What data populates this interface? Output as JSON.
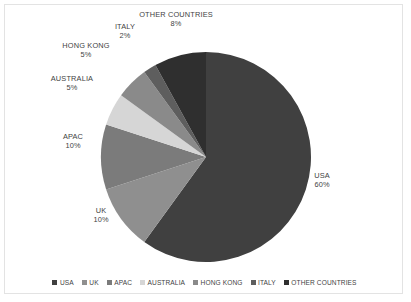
{
  "chart_data": {
    "type": "pie",
    "title": "",
    "categories": [
      "USA",
      "UK",
      "APAC",
      "AUSTRALIA",
      "HONG KONG",
      "ITALY",
      "OTHER COUNTRIES"
    ],
    "values": [
      60,
      10,
      10,
      5,
      5,
      2,
      8
    ],
    "value_unit": "%",
    "labels": [
      {
        "name": "USA",
        "pct": "60%"
      },
      {
        "name": "UK",
        "pct": "10%"
      },
      {
        "name": "APAC",
        "pct": "10%"
      },
      {
        "name": "AUSTRALIA",
        "pct": "5%"
      },
      {
        "name": "HONG KONG",
        "pct": "5%"
      },
      {
        "name": "ITALY",
        "pct": "2%"
      },
      {
        "name": "OTHER COUNTRIES",
        "pct": "8%"
      }
    ],
    "colors": [
      "#404040",
      "#8f8f8f",
      "#7b7b7b",
      "#d6d6d6",
      "#8a8a8a",
      "#5e5e5e",
      "#2f2f2f"
    ],
    "legend_position": "bottom",
    "start_angle_deg": 0,
    "direction": "clockwise",
    "grid": false
  },
  "legend": {
    "items": [
      {
        "label": "USA",
        "color": "#404040"
      },
      {
        "label": "UK",
        "color": "#8f8f8f"
      },
      {
        "label": "APAC",
        "color": "#7b7b7b"
      },
      {
        "label": "AUSTRALIA",
        "color": "#d6d6d6"
      },
      {
        "label": "HONG KONG",
        "color": "#8a8a8a"
      },
      {
        "label": "ITALY",
        "color": "#5e5e5e"
      },
      {
        "label": "OTHER COUNTRIES",
        "color": "#2f2f2f"
      }
    ]
  },
  "frame": {
    "border_color": "#e3e3e3",
    "background": "#ffffff"
  }
}
